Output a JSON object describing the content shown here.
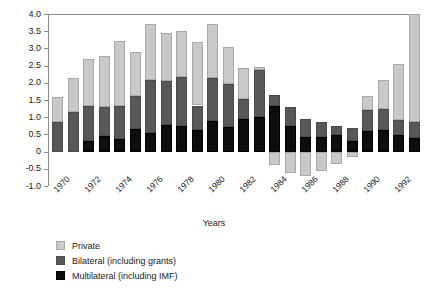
{
  "chart_data": {
    "type": "bar",
    "stacked": true,
    "title": "",
    "xlabel": "Years",
    "ylabel": "",
    "ylim": [
      -1.0,
      4.0
    ],
    "ytick_labels": [
      "4.0",
      "3.5",
      "3.0",
      "2.5",
      "2.0",
      "1.5",
      "1.0",
      "0.5",
      "0",
      "-0.5",
      "-1.0"
    ],
    "ytick_values": [
      4.0,
      3.5,
      3.0,
      2.5,
      2.0,
      1.5,
      1.0,
      0.5,
      0,
      -0.5,
      -1.0
    ],
    "grid": false,
    "legend_position": "bottom-left",
    "x": [
      1970,
      1971,
      1972,
      1973,
      1974,
      1975,
      1976,
      1977,
      1978,
      1979,
      1980,
      1981,
      1982,
      1983,
      1984,
      1985,
      1986,
      1987,
      1988,
      1989,
      1990,
      1991,
      1992,
      1993
    ],
    "xtick_labels": [
      "1970",
      "1972",
      "1974",
      "1976",
      "1978",
      "1980",
      "1982",
      "1984",
      "1986",
      "1988",
      "1990",
      "1992"
    ],
    "xtick_values": [
      1970,
      1972,
      1974,
      1976,
      1978,
      1980,
      1982,
      1984,
      1986,
      1988,
      1990,
      1992
    ],
    "series": [
      {
        "name": "Multilateral (including IMF)",
        "color": "#0d0d0d",
        "values": [
          0.0,
          0.0,
          0.32,
          0.45,
          0.37,
          0.65,
          0.55,
          0.77,
          0.74,
          0.62,
          0.9,
          0.72,
          0.95,
          1.02,
          1.32,
          0.75,
          0.42,
          0.42,
          0.47,
          0.32,
          0.6,
          0.62,
          0.47,
          0.4
        ]
      },
      {
        "name": "Bilateral (including grants)",
        "color": "#585858",
        "values": [
          0.85,
          1.15,
          1.0,
          0.85,
          0.95,
          0.98,
          1.52,
          1.28,
          1.44,
          0.72,
          1.25,
          1.25,
          0.57,
          1.35,
          0.32,
          0.55,
          0.52,
          0.45,
          0.27,
          0.38,
          0.6,
          0.62,
          0.45,
          0.45
        ]
      },
      {
        "name": "Private",
        "color": "#c9c9c9",
        "values": [
          0.75,
          1.0,
          1.38,
          1.47,
          1.9,
          1.27,
          1.63,
          1.4,
          1.32,
          1.85,
          1.55,
          1.08,
          0.92,
          0.08,
          -0.4,
          -0.62,
          -0.7,
          -0.55,
          -0.35,
          -0.15,
          0.42,
          0.85,
          1.62,
          3.15
        ]
      }
    ],
    "totals_positive": [
      1.6,
      2.15,
      2.7,
      2.77,
      3.22,
      2.9,
      3.7,
      3.45,
      3.5,
      3.19,
      3.7,
      3.05,
      2.44,
      2.45,
      1.64,
      1.3,
      0.94,
      0.87,
      0.74,
      0.7,
      1.62,
      2.09,
      2.54,
      4.0
    ]
  },
  "legend": {
    "items": [
      {
        "label": "Private",
        "key": "private"
      },
      {
        "label": "Bilateral (including grants)",
        "key": "bilateral"
      },
      {
        "label": "Multilateral (including IMF)",
        "key": "multilateral"
      }
    ]
  },
  "axis": {
    "x_title": "Years"
  }
}
